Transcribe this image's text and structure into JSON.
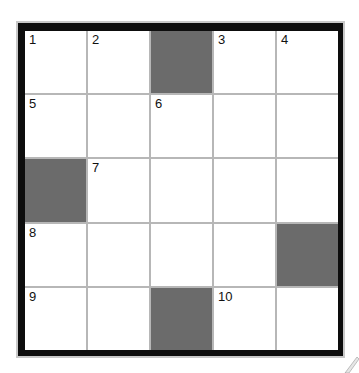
{
  "puzzle": {
    "type": "crossword",
    "rows": 5,
    "cols": 5,
    "colors": {
      "border": "#0d0d0d",
      "gridline": "#b7b7b7",
      "block": "#6b6b6b",
      "cell": "#ffffff"
    },
    "cells": [
      [
        {
          "num": "1"
        },
        {
          "num": "2"
        },
        {
          "block": true
        },
        {
          "num": "3"
        },
        {
          "num": "4"
        }
      ],
      [
        {
          "num": "5"
        },
        {},
        {
          "num": "6"
        },
        {},
        {}
      ],
      [
        {
          "block": true
        },
        {
          "num": "7"
        },
        {},
        {},
        {}
      ],
      [
        {
          "num": "8"
        },
        {},
        {},
        {},
        {
          "block": true
        }
      ],
      [
        {
          "num": "9"
        },
        {},
        {
          "block": true
        },
        {
          "num": "10"
        },
        {}
      ]
    ]
  }
}
